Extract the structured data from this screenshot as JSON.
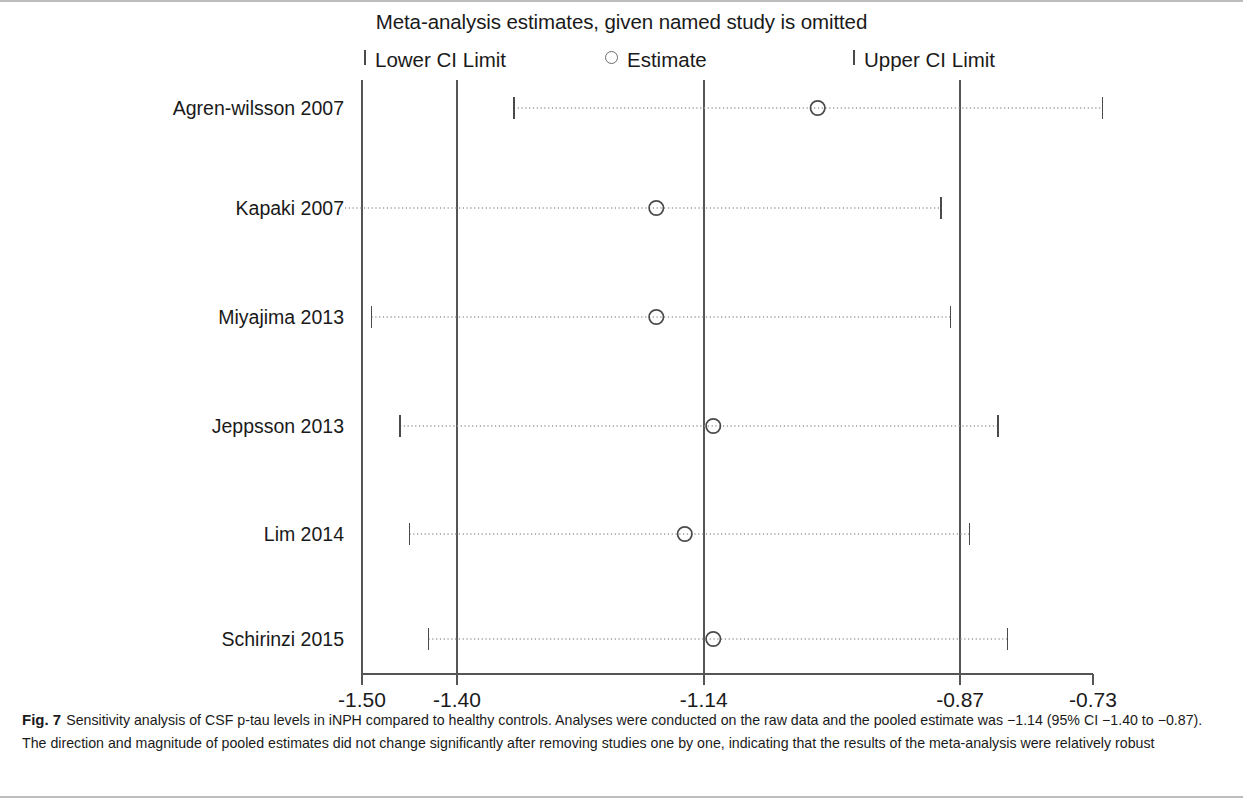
{
  "figure": {
    "title": "Meta-analysis estimates, given named study is omitted",
    "legend": [
      {
        "id": "lower-ci-limit",
        "label": "Lower CI Limit",
        "marker": "tick",
        "x_px": 364
      },
      {
        "id": "estimate",
        "label": "Estimate",
        "marker": "circle",
        "x_px": 605
      },
      {
        "id": "upper-ci-limit",
        "label": "Upper CI Limit",
        "marker": "tick",
        "x_px": 853
      }
    ],
    "caption_number": "Fig. 7",
    "caption_text": "Sensitivity analysis of CSF p-tau levels in iNPH compared to healthy controls. Analyses were conducted on the raw data and the pooled estimate was −1.14 (95% CI −1.40 to −0.87). The direction and magnitude of pooled estimates did not change significantly after removing studies one by one, indicating that the results of the meta-analysis were relatively robust",
    "colors": {
      "axis": "#555555",
      "gridline": "#555555",
      "marker_outline": "#4a4a4a",
      "ci_line": "#9a9a9a",
      "text": "#1a1a1a",
      "frame": "#bdbdbd"
    }
  },
  "chart_data": {
    "type": "scatter",
    "title": "Meta-analysis estimates, given named study is omitted",
    "xlabel": "",
    "ylabel": "",
    "xlim": [
      -1.545,
      -0.715
    ],
    "xticks": [
      -1.5,
      -1.4,
      -1.14,
      -0.87,
      -0.73
    ],
    "xticklabels": [
      "-1.50",
      "-1.40",
      "-1.14",
      "-0.87",
      "-0.73"
    ],
    "gridlines_vertical": [
      -1.5,
      -1.4,
      -1.14,
      -0.87
    ],
    "grid": false,
    "legend_position": "top",
    "categories": [
      "Agren-wilsson 2007",
      "Kapaki 2007",
      "Miyajima 2013",
      "Jeppsson 2013",
      "Lim 2014",
      "Schirinzi 2015"
    ],
    "series": [
      {
        "name": "Estimate",
        "values": [
          -1.02,
          -1.19,
          -1.19,
          -1.13,
          -1.16,
          -1.13
        ]
      },
      {
        "name": "Lower CI Limit",
        "values": [
          -1.34,
          -1.54,
          -1.49,
          -1.46,
          -1.45,
          -1.43
        ]
      },
      {
        "name": "Upper CI Limit",
        "values": [
          -0.72,
          -0.89,
          -0.88,
          -0.83,
          -0.86,
          -0.82
        ]
      }
    ],
    "points": [
      {
        "study": "Agren-wilsson 2007",
        "estimate": -1.02,
        "lower": -1.34,
        "upper": -0.72
      },
      {
        "study": "Kapaki 2007",
        "estimate": -1.19,
        "lower": -1.54,
        "upper": -0.89
      },
      {
        "study": "Miyajima 2013",
        "estimate": -1.19,
        "lower": -1.49,
        "upper": -0.88
      },
      {
        "study": "Jeppsson 2013",
        "estimate": -1.13,
        "lower": -1.46,
        "upper": -0.83
      },
      {
        "study": "Lim 2014",
        "estimate": -1.16,
        "lower": -1.45,
        "upper": -0.86
      },
      {
        "study": "Schirinzi 2015",
        "estimate": -1.13,
        "lower": -1.43,
        "upper": -0.82
      }
    ],
    "pooled_estimate": -1.14,
    "pooled_ci": [
      -1.4,
      -0.87
    ]
  }
}
